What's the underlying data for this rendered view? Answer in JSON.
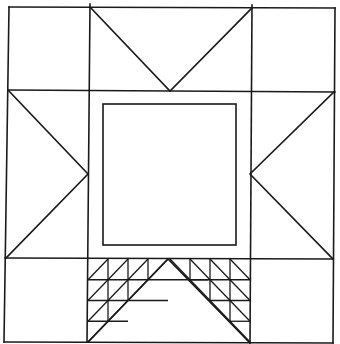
{
  "diagram": {
    "type": "quilt-block-pattern",
    "line_color": "#1a1a1a",
    "background_color": "#ffffff",
    "grid": {
      "rows": 3,
      "cols": 3
    },
    "corner_squares": [
      "top-left",
      "top-right",
      "bottom-left",
      "bottom-right"
    ],
    "star_points": [
      "top",
      "left",
      "right",
      "bottom"
    ],
    "center": "framed square",
    "bottom_point_fill": {
      "pattern": "half-square triangles",
      "staircase_rows": [
        3,
        2,
        1,
        0
      ]
    }
  }
}
